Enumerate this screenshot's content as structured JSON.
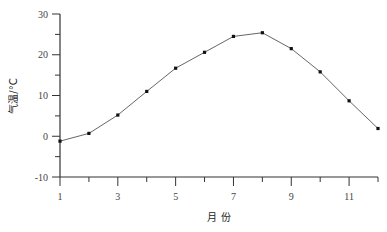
{
  "chart_data": {
    "type": "line",
    "title": "",
    "xlabel": "月 份",
    "ylabel": "气温/°C",
    "x": [
      1,
      2,
      3,
      4,
      5,
      6,
      7,
      8,
      9,
      10,
      11,
      12
    ],
    "series": [
      {
        "name": "气温",
        "values": [
          -1.2,
          0.7,
          5.2,
          11.0,
          16.7,
          20.6,
          24.5,
          25.4,
          21.5,
          15.8,
          8.7,
          1.9
        ]
      }
    ],
    "xlim": [
      1,
      12
    ],
    "ylim": [
      -10,
      30
    ],
    "x_tick_labels": [
      "1",
      "3",
      "5",
      "7",
      "9",
      "11"
    ],
    "y_tick_labels": [
      "30",
      "20",
      "10",
      "0",
      "-10"
    ],
    "grid": false,
    "legend": null,
    "colors": {
      "line": "#555555",
      "marker": "#111111",
      "axis": "#333333"
    }
  }
}
